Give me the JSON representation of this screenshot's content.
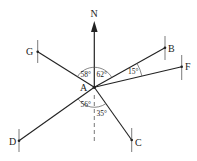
{
  "diagram": {
    "type": "bearing-diagram",
    "center": {
      "label": "A"
    },
    "north": {
      "label": "N"
    },
    "points": [
      {
        "label": "G"
      },
      {
        "label": "B"
      },
      {
        "label": "F"
      },
      {
        "label": "D"
      },
      {
        "label": "C"
      }
    ],
    "angles": [
      {
        "value": "58°",
        "between": "G-N"
      },
      {
        "value": "62°",
        "between": "N-B"
      },
      {
        "value": "15°",
        "between": "B-F"
      },
      {
        "value": "56°",
        "between": "D-S"
      },
      {
        "value": "35°",
        "between": "S-C"
      }
    ],
    "colors": {
      "line": "#222222",
      "background": "#ffffff",
      "arc": "#555555"
    }
  }
}
